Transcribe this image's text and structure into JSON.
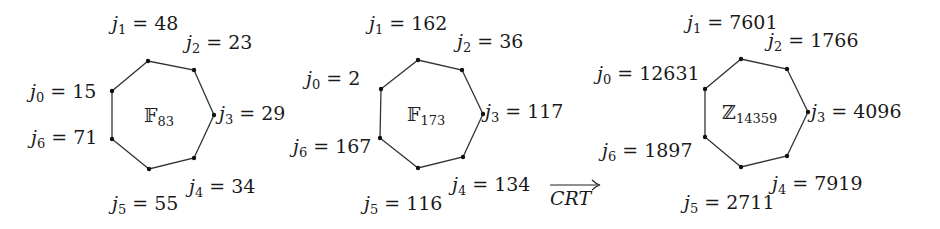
{
  "diagrams": [
    {
      "field": "𝔽",
      "field_sub": "83",
      "labels": {
        "j0": "15",
        "j1": "48",
        "j2": "23",
        "j3": "29",
        "j4": "34",
        "j5": "55",
        "j6": "71"
      }
    },
    {
      "field": "𝔽",
      "field_sub": "173",
      "labels": {
        "j0": "2",
        "j1": "162",
        "j2": "36",
        "j3": "117",
        "j4": "134",
        "j5": "116",
        "j6": "167"
      }
    },
    {
      "field": "ℤ",
      "field_sub": "14359",
      "labels": {
        "j0": "12631",
        "j1": "7601",
        "j2": "1766",
        "j3": "4096",
        "j4": "7919",
        "j5": "2711",
        "j6": "1897"
      }
    }
  ],
  "arrow": {
    "label": "CRT"
  },
  "symbols": {
    "var": "j",
    "eq": " = "
  },
  "subs": {
    "s0": "0",
    "s1": "1",
    "s2": "2",
    "s3": "3",
    "s4": "4",
    "s5": "5",
    "s6": "6"
  }
}
